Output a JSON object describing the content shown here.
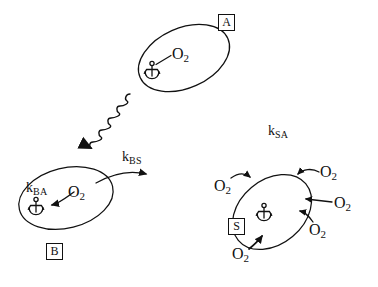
{
  "figure": {
    "type": "diagram",
    "background_color": "#ffffff",
    "line_color": "#111111"
  },
  "states": [
    {
      "id": "A",
      "box_label": "A",
      "box_x": 218,
      "box_y": 14,
      "ellipse": {
        "cx": 184,
        "cy": 58,
        "rx": 48,
        "ry": 30,
        "rotate": -24
      },
      "anchor": {
        "x": 152,
        "y": 72,
        "name": "anchor-icon"
      },
      "molecule": {
        "text": "O",
        "subscript": "2",
        "x": 177,
        "y": 48
      },
      "bond": {
        "from": [
          158,
          68
        ],
        "to": [
          176,
          57
        ]
      }
    },
    {
      "id": "B",
      "box_label": "B",
      "box_x": 46,
      "box_y": 243,
      "ellipse": {
        "cx": 66,
        "cy": 198,
        "rx": 48,
        "ry": 30,
        "rotate": -14
      },
      "anchor": {
        "x": 36,
        "y": 208,
        "name": "anchor-icon"
      },
      "molecule": {
        "text": "O",
        "subscript": "2",
        "x": 70,
        "y": 190
      },
      "rate_label": {
        "text": "k",
        "subscript": "BA",
        "x": 28,
        "y": 182
      }
    },
    {
      "id": "S",
      "box_label": "S",
      "box_x": 228,
      "box_y": 218,
      "ellipse": {
        "cx": 272,
        "cy": 213,
        "rx": 44,
        "ry": 32,
        "rotate": -40
      },
      "anchor": {
        "x": 264,
        "y": 212,
        "name": "anchor-icon"
      },
      "molecules": [
        {
          "text": "O",
          "subscript": "2",
          "x": 222,
          "y": 181,
          "position": "upper-left"
        },
        {
          "text": "O",
          "subscript": "2",
          "x": 322,
          "y": 175,
          "position": "upper-right"
        },
        {
          "text": "O",
          "subscript": "2",
          "x": 336,
          "y": 207,
          "position": "right"
        },
        {
          "text": "O",
          "subscript": "2",
          "x": 310,
          "y": 225,
          "position": "lower-right"
        },
        {
          "text": "O",
          "subscript": "2",
          "x": 236,
          "y": 250,
          "position": "lower-left"
        }
      ]
    }
  ],
  "rate_constants": [
    {
      "id": "k_BS",
      "text": "k",
      "subscript": "BS",
      "x": 124,
      "y": 152
    },
    {
      "id": "k_SA",
      "text": "k",
      "subscript": "SA",
      "x": 268,
      "y": 124
    },
    {
      "id": "k_BA",
      "text": "k",
      "subscript": "BA",
      "x": 28,
      "y": 182
    }
  ],
  "arrows": {
    "wavy_photon": {
      "name": "wavy-photon-arrow",
      "from": [
        128,
        95
      ],
      "to": [
        72,
        152
      ],
      "style": "squiggle",
      "head": "solid-triangle"
    },
    "b_to_s": {
      "name": "b-to-s-arrow",
      "from": [
        95,
        180
      ],
      "to": [
        150,
        172
      ],
      "style": "curved",
      "head": "solid-triangle"
    },
    "b_internal": {
      "name": "o2-to-anchor-arrow",
      "from": [
        70,
        192
      ],
      "to": [
        44,
        205
      ],
      "style": "curved",
      "head": "solid-triangle"
    },
    "s_inbound": [
      {
        "name": "s-o2-arrow-upper-left",
        "head": "solid-triangle"
      },
      {
        "name": "s-o2-arrow-upper-right",
        "head": "solid-triangle"
      },
      {
        "name": "s-o2-arrow-right",
        "head": "solid-triangle"
      },
      {
        "name": "s-o2-arrow-lower-right",
        "head": "solid-triangle"
      },
      {
        "name": "s-o2-arrow-lower-left",
        "head": "solid-triangle"
      }
    ]
  }
}
